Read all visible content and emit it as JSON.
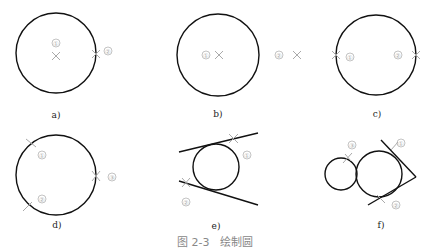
{
  "figure": {
    "caption": "图 2-3   绘制圆",
    "panels": [
      {
        "id": "a",
        "label": "a)",
        "desc": "Circle by center ① and point ② on circumference"
      },
      {
        "id": "b",
        "label": "b)",
        "desc": "Circle by center ① and radius point ②"
      },
      {
        "id": "c",
        "label": "c)",
        "desc": "Circle by two points ① ② (diameter)"
      },
      {
        "id": "d",
        "label": "d)",
        "desc": "Circle by three points ① ② ③"
      },
      {
        "id": "e",
        "label": "e)",
        "desc": "Circle tangent to two lines at ① ②"
      },
      {
        "id": "f",
        "label": "f)",
        "desc": "Circle tangent to two lines ① ② and a circle ③"
      }
    ],
    "markers": {
      "one": "①",
      "two": "②",
      "three": "③"
    },
    "colors": {
      "stroke": "#111111",
      "marker": "#aaaaaa",
      "caption": "#888888"
    }
  }
}
